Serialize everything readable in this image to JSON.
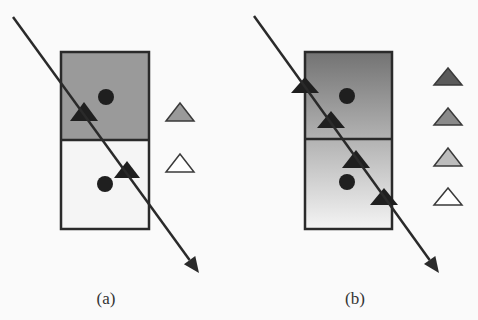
{
  "panels": [
    {
      "id": "a",
      "caption": "(a)",
      "box": {
        "x": 61,
        "y": 52,
        "w": 88,
        "h": 177,
        "divider_y": 140,
        "top_fill": "#9a9a9a",
        "bottom_fill": "#f5f5f5",
        "fill_type": "split"
      },
      "dots": [
        {
          "cx": 106,
          "cy": 97
        },
        {
          "cx": 105,
          "cy": 184
        }
      ],
      "triangles": [
        {
          "cx": 84,
          "top": 102,
          "base": 121,
          "half_w": 14
        },
        {
          "cx": 127,
          "top": 161,
          "base": 178,
          "half_w": 13
        }
      ],
      "arrow": {
        "x1": 13,
        "y1": 17,
        "x2": 199,
        "y2": 273
      },
      "legend": [
        {
          "cx": 180,
          "top": 103,
          "base": 121,
          "fill": "#9a9a9a"
        },
        {
          "cx": 180,
          "top": 154,
          "base": 172,
          "fill": "#ffffff"
        }
      ],
      "caption_pos": {
        "x": 106,
        "y": 289
      }
    },
    {
      "id": "b",
      "caption": "(b)",
      "box": {
        "x": 305,
        "y": 52,
        "w": 87,
        "h": 177,
        "divider_y": 139,
        "gradient_top": "#737373",
        "gradient_bottom": "#f4f4f4",
        "fill_type": "gradient"
      },
      "dots": [
        {
          "cx": 347,
          "cy": 96
        },
        {
          "cx": 347,
          "cy": 182
        }
      ],
      "triangles": [
        {
          "cx": 305,
          "top": 77,
          "base": 93,
          "half_w": 14
        },
        {
          "cx": 331,
          "top": 111,
          "base": 128,
          "half_w": 14
        },
        {
          "cx": 356,
          "top": 150,
          "base": 168,
          "half_w": 14
        },
        {
          "cx": 384,
          "top": 188,
          "base": 205,
          "half_w": 14
        }
      ],
      "arrow": {
        "x1": 254,
        "y1": 16,
        "x2": 439,
        "y2": 273
      },
      "legend": [
        {
          "cx": 448,
          "top": 68,
          "base": 85,
          "fill": "#5a5a5a"
        },
        {
          "cx": 448,
          "top": 108,
          "base": 125,
          "fill": "#8a8a8a"
        },
        {
          "cx": 448,
          "top": 148,
          "base": 166,
          "fill": "#bdbdbd"
        },
        {
          "cx": 448,
          "top": 188,
          "base": 205,
          "fill": "#ffffff"
        }
      ],
      "caption_pos": {
        "x": 355,
        "y": 289
      }
    }
  ],
  "colors": {
    "stroke": "#2a2a2a",
    "marker": "#1f1f1f"
  }
}
